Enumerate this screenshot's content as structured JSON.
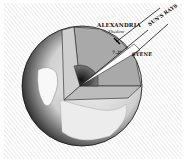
{
  "diagram": {
    "labels": {
      "alexandria": "ALEXANDRIA",
      "shadow": "Shadow",
      "suns_rays": "SUN'S RAYS",
      "angle": "7.2°",
      "syene": "SYENE"
    },
    "colors": {
      "background": "#ffffff",
      "hatch": "#bdbdbd",
      "globe_light": "#e6e6e6",
      "globe_dark": "#1a1a1a",
      "cutaway": "#9a9a9a",
      "ink": "#111111"
    }
  }
}
